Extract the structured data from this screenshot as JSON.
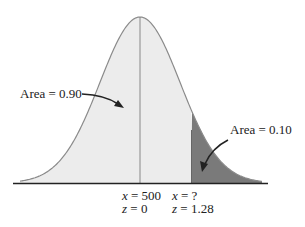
{
  "chart_data": {
    "type": "area",
    "title": "",
    "mean": {
      "x": 500,
      "z": 0
    },
    "cutoff": {
      "x": "?",
      "z": 1.28
    },
    "regions": [
      {
        "name": "left",
        "label": "Area = 0.90",
        "value": 0.9,
        "color": "#ececec"
      },
      {
        "name": "right-tail",
        "label": "Area = 0.10",
        "value": 0.1,
        "color": "#7a7a7a"
      }
    ]
  },
  "labels": {
    "area_left": "Area = 0.90",
    "area_right": "Area = 0.10",
    "mean_x": "x = 500",
    "mean_z": "z = 0",
    "cut_x": "x = ?",
    "cut_z": "z = 1.28"
  },
  "colors": {
    "curve": "#8a8a8a",
    "fill_main": "#ececec",
    "fill_tail": "#7a7a7a",
    "axis": "#222222"
  }
}
